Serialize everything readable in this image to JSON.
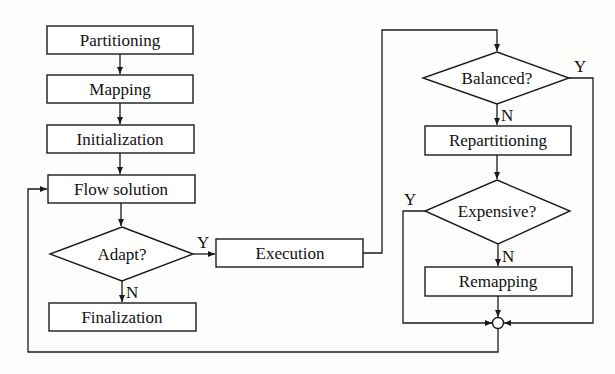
{
  "diagram": {
    "type": "flowchart",
    "nodes": {
      "partitioning": {
        "label": "Partitioning",
        "shape": "box"
      },
      "mapping": {
        "label": "Mapping",
        "shape": "box"
      },
      "initialization": {
        "label": "Initialization",
        "shape": "box"
      },
      "flow_solution": {
        "label": "Flow solution",
        "shape": "box"
      },
      "adapt": {
        "label": "Adapt?",
        "shape": "diamond"
      },
      "finalization": {
        "label": "Finalization",
        "shape": "box"
      },
      "execution": {
        "label": "Execution",
        "shape": "box"
      },
      "balanced": {
        "label": "Balanced?",
        "shape": "diamond"
      },
      "repartitioning": {
        "label": "Repartitioning",
        "shape": "box"
      },
      "expensive": {
        "label": "Expensive?",
        "shape": "diamond"
      },
      "remapping": {
        "label": "Remapping",
        "shape": "box"
      },
      "merge": {
        "label": "",
        "shape": "circle"
      }
    },
    "edge_labels": {
      "adapt_yes": "Y",
      "adapt_no": "N",
      "balanced_yes": "Y",
      "balanced_no": "N",
      "expensive_yes": "Y",
      "expensive_no": "N"
    },
    "edges": [
      {
        "from": "partitioning",
        "to": "mapping"
      },
      {
        "from": "mapping",
        "to": "initialization"
      },
      {
        "from": "initialization",
        "to": "flow_solution"
      },
      {
        "from": "flow_solution",
        "to": "adapt"
      },
      {
        "from": "adapt",
        "to": "execution",
        "label": "Y"
      },
      {
        "from": "adapt",
        "to": "finalization",
        "label": "N"
      },
      {
        "from": "execution",
        "to": "balanced"
      },
      {
        "from": "balanced",
        "to": "merge",
        "label": "Y"
      },
      {
        "from": "balanced",
        "to": "repartitioning",
        "label": "N"
      },
      {
        "from": "repartitioning",
        "to": "expensive"
      },
      {
        "from": "expensive",
        "to": "merge",
        "label": "Y"
      },
      {
        "from": "expensive",
        "to": "remapping",
        "label": "N"
      },
      {
        "from": "remapping",
        "to": "merge"
      },
      {
        "from": "merge",
        "to": "flow_solution"
      }
    ]
  }
}
